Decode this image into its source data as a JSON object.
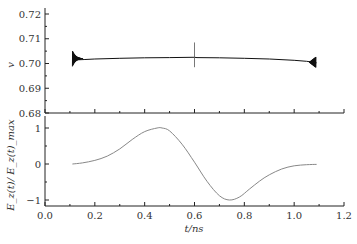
{
  "chart_data": [
    {
      "type": "line",
      "panel": "top",
      "title": "",
      "xlabel": "",
      "ylabel": "v",
      "xlim": [
        0.0,
        1.2
      ],
      "ylim": [
        0.68,
        0.72
      ],
      "yticks": [
        "0.68",
        "0.69",
        "0.70",
        "0.71",
        "0.72"
      ],
      "grid": false,
      "series": [
        {
          "name": "v",
          "color": "#111111",
          "x": [
            0.11,
            0.13,
            0.16,
            0.2,
            0.3,
            0.4,
            0.5,
            0.59,
            0.6,
            0.61,
            0.7,
            0.8,
            0.9,
            1.0,
            1.05,
            1.08,
            1.09
          ],
          "y": [
            0.702,
            0.7015,
            0.7016,
            0.7018,
            0.7021,
            0.7023,
            0.7024,
            0.7025,
            0.7025,
            0.7024,
            0.7023,
            0.7021,
            0.7018,
            0.7013,
            0.7009,
            0.7005,
            0.7003
          ]
        }
      ],
      "annotations": [
        {
          "note": "high-frequency oscillation burst near t=0.11, amplitude ~±0.003"
        },
        {
          "note": "spike near t=0.60, amplitude ~±0.006"
        },
        {
          "note": "oscillation burst near t=1.08, amplitude ~±0.002"
        }
      ]
    },
    {
      "type": "line",
      "panel": "bottom",
      "title": "",
      "xlabel": "t/ns",
      "ylabel": "E_z(t)/ E_z(t)_max",
      "xlim": [
        0.0,
        1.2
      ],
      "ylim": [
        -1.15,
        1.2
      ],
      "xticks": [
        "0.0",
        "0.2",
        "0.4",
        "0.6",
        "0.8",
        "1.0",
        "1.2"
      ],
      "yticks": [
        "-1",
        "0",
        "1"
      ],
      "grid": false,
      "series": [
        {
          "name": "E_z normalized",
          "color": "#888888",
          "x": [
            0.11,
            0.15,
            0.2,
            0.25,
            0.3,
            0.35,
            0.4,
            0.45,
            0.47,
            0.5,
            0.55,
            0.6,
            0.65,
            0.7,
            0.74,
            0.78,
            0.82,
            0.86,
            0.9,
            0.95,
            1.0,
            1.05,
            1.09
          ],
          "y": [
            0.0,
            0.03,
            0.1,
            0.22,
            0.42,
            0.68,
            0.9,
            1.0,
            1.0,
            0.92,
            0.55,
            0.05,
            -0.48,
            -0.88,
            -1.0,
            -0.92,
            -0.7,
            -0.48,
            -0.3,
            -0.14,
            -0.05,
            -0.02,
            -0.01
          ]
        }
      ]
    }
  ],
  "labels": {
    "top_ylabel": "v",
    "bottom_ylabel": "E_z(t)/ E_z(t)_max",
    "xlabel": "t/ns",
    "xticks": [
      "0.0",
      "0.2",
      "0.4",
      "0.6",
      "0.8",
      "1.0",
      "1.2"
    ],
    "top_yticks": [
      "0.68",
      "0.69",
      "0.70",
      "0.71",
      "0.72"
    ],
    "bottom_yticks": [
      "1",
      "0",
      "-1"
    ]
  }
}
